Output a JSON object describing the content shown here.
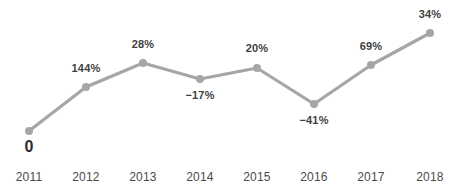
{
  "chart_data": {
    "type": "line",
    "title": "",
    "subtitle": "",
    "xlabel": "",
    "ylabel": "",
    "grid": false,
    "legend": "none",
    "categories": [
      "2011",
      "2012",
      "2013",
      "2014",
      "2015",
      "2016",
      "2017",
      "2018"
    ],
    "series": [
      {
        "name": "Growth",
        "values": [
          0,
          144,
          28,
          -17,
          20,
          -41,
          69,
          34
        ],
        "point_labels": [
          "0",
          "144%",
          "28%",
          "−17%",
          "20%",
          "−41%",
          "69%",
          "34%"
        ],
        "label_positions": [
          "below",
          "above",
          "above",
          "below",
          "above",
          "below",
          "above",
          "above"
        ]
      }
    ],
    "colors": {
      "line": "#a6a6a6",
      "marker": "#a6a6a6",
      "data_label_text": "#3f3f3f",
      "tick_label_text": "#4a4a4a",
      "background": "#ffffff"
    },
    "pixel_points": [
      {
        "x": 29,
        "y": 131
      },
      {
        "x": 86,
        "y": 87
      },
      {
        "x": 143,
        "y": 63
      },
      {
        "x": 200,
        "y": 79
      },
      {
        "x": 257,
        "y": 68
      },
      {
        "x": 314,
        "y": 104
      },
      {
        "x": 371,
        "y": 65
      },
      {
        "x": 430,
        "y": 33
      }
    ],
    "marker_radius": 4,
    "line_width": 3.2
  },
  "labels": {
    "p0": "0",
    "p1": "144%",
    "p2": "28%",
    "p3": "−17%",
    "p4": "20%",
    "p5": "−41%",
    "p6": "69%",
    "p7": "34%"
  },
  "ticks": {
    "t0": "2011",
    "t1": "2012",
    "t2": "2013",
    "t3": "2014",
    "t4": "2015",
    "t5": "2016",
    "t6": "2017",
    "t7": "2018"
  }
}
